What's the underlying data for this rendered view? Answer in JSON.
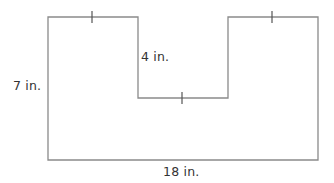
{
  "diagram": {
    "type": "composite-shape",
    "stroke_color": "#8a8a8a",
    "text_color": "#333333",
    "labels": {
      "height": "7 in.",
      "notch_depth": "4 in.",
      "width": "18 in."
    },
    "outline_points": [
      [
        48,
        17
      ],
      [
        138,
        17
      ],
      [
        138,
        98
      ],
      [
        228,
        98
      ],
      [
        228,
        17
      ],
      [
        318,
        17
      ],
      [
        318,
        160
      ],
      [
        48,
        160
      ]
    ],
    "tick_marks": [
      {
        "segment": "top-left",
        "x": 92,
        "y": 17
      },
      {
        "segment": "notch-bottom",
        "x": 182,
        "y": 98
      },
      {
        "segment": "top-right",
        "x": 272,
        "y": 17
      }
    ]
  }
}
